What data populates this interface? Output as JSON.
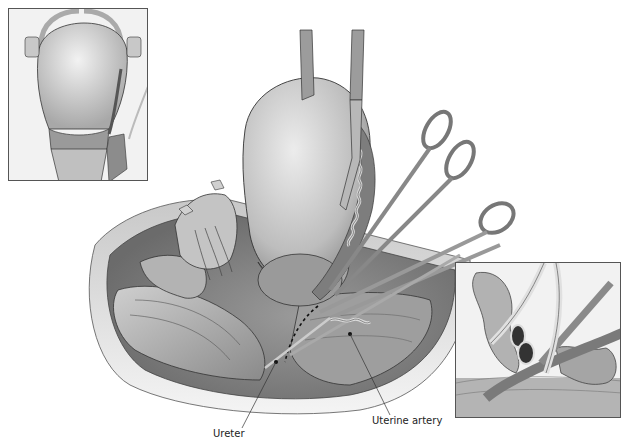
{
  "figure": {
    "labels": {
      "ureter": "Ureter",
      "uterine_artery": "Uterine artery"
    },
    "colors": {
      "background": "#ffffff",
      "tissue_light": "#d6d6d6",
      "tissue_mid": "#a8a8a8",
      "tissue_dark": "#6a6a6a",
      "outline": "#333333",
      "inset_bg": "#f2f2f2"
    },
    "insets": [
      {
        "name": "top-left-inset",
        "x": 8,
        "y": 8,
        "w": 140,
        "h": 173
      },
      {
        "name": "bottom-right-inset",
        "x": 455,
        "y": 262,
        "w": 166,
        "h": 156
      }
    ]
  }
}
